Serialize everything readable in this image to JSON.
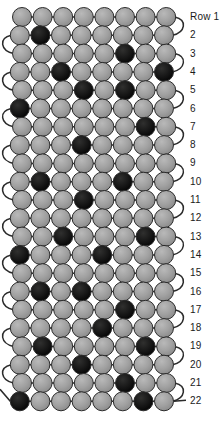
{
  "legend": {
    "gray_bead_label": "light bead",
    "dark_bead_label": "dark bead",
    "gray_color": "#9a9a9a",
    "dark_color": "#1a1a1a",
    "outline_color": "#2b2b2b",
    "thread_color": "#2b2b2b",
    "background_color": "#ffffff"
  },
  "row_label_prefix": "Row",
  "row_labels": [
    "Row 1",
    "2",
    "3",
    "4",
    "5",
    "6",
    "7",
    "8",
    "9",
    "10",
    "11",
    "12",
    "13",
    "14",
    "15",
    "16",
    "17",
    "18",
    "19",
    "20",
    "21",
    "22"
  ],
  "chart_data": {
    "type": "heatmap",
    "xlabel": "",
    "ylabel": "",
    "beads_per_row": 8,
    "row_count": 22,
    "value_legend": {
      "0": "gray bead",
      "1": "dark bead"
    },
    "categories": [
      "1",
      "2",
      "3",
      "4",
      "5",
      "6",
      "7",
      "8"
    ],
    "rows": [
      {
        "row": 1,
        "label": "Row 1",
        "dark_positions": [],
        "values": [
          0,
          0,
          0,
          0,
          0,
          0,
          0,
          0
        ]
      },
      {
        "row": 2,
        "label": "2",
        "dark_positions": [
          2
        ],
        "values": [
          0,
          1,
          0,
          0,
          0,
          0,
          0,
          0
        ]
      },
      {
        "row": 3,
        "label": "3",
        "dark_positions": [
          6
        ],
        "values": [
          0,
          0,
          0,
          0,
          0,
          1,
          0,
          0
        ]
      },
      {
        "row": 4,
        "label": "4",
        "dark_positions": [
          3,
          8
        ],
        "values": [
          0,
          0,
          1,
          0,
          0,
          0,
          0,
          1
        ]
      },
      {
        "row": 5,
        "label": "5",
        "dark_positions": [
          4,
          6
        ],
        "values": [
          0,
          0,
          0,
          1,
          0,
          1,
          0,
          0
        ]
      },
      {
        "row": 6,
        "label": "6",
        "dark_positions": [
          1
        ],
        "values": [
          1,
          0,
          0,
          0,
          0,
          0,
          0,
          0
        ]
      },
      {
        "row": 7,
        "label": "7",
        "dark_positions": [
          7
        ],
        "values": [
          0,
          0,
          0,
          0,
          0,
          0,
          1,
          0
        ]
      },
      {
        "row": 8,
        "label": "8",
        "dark_positions": [
          4
        ],
        "values": [
          0,
          0,
          0,
          1,
          0,
          0,
          0,
          0
        ]
      },
      {
        "row": 9,
        "label": "9",
        "dark_positions": [],
        "values": [
          0,
          0,
          0,
          0,
          0,
          0,
          0,
          0
        ]
      },
      {
        "row": 10,
        "label": "10",
        "dark_positions": [
          2,
          6
        ],
        "values": [
          0,
          1,
          0,
          0,
          0,
          1,
          0,
          0
        ]
      },
      {
        "row": 11,
        "label": "11",
        "dark_positions": [
          4
        ],
        "values": [
          0,
          0,
          0,
          1,
          0,
          0,
          0,
          0
        ]
      },
      {
        "row": 12,
        "label": "12",
        "dark_positions": [],
        "values": [
          0,
          0,
          0,
          0,
          0,
          0,
          0,
          0
        ]
      },
      {
        "row": 13,
        "label": "13",
        "dark_positions": [
          3,
          7
        ],
        "values": [
          0,
          0,
          1,
          0,
          0,
          0,
          1,
          0
        ]
      },
      {
        "row": 14,
        "label": "14",
        "dark_positions": [
          1,
          5
        ],
        "values": [
          1,
          0,
          0,
          0,
          1,
          0,
          0,
          0
        ]
      },
      {
        "row": 15,
        "label": "15",
        "dark_positions": [],
        "values": [
          0,
          0,
          0,
          0,
          0,
          0,
          0,
          0
        ]
      },
      {
        "row": 16,
        "label": "16",
        "dark_positions": [
          2,
          4
        ],
        "values": [
          0,
          1,
          0,
          1,
          0,
          0,
          0,
          0
        ]
      },
      {
        "row": 17,
        "label": "17",
        "dark_positions": [
          6
        ],
        "values": [
          0,
          0,
          0,
          0,
          0,
          1,
          0,
          0
        ]
      },
      {
        "row": 18,
        "label": "18",
        "dark_positions": [
          5
        ],
        "values": [
          0,
          0,
          0,
          0,
          1,
          0,
          0,
          0
        ]
      },
      {
        "row": 19,
        "label": "19",
        "dark_positions": [
          2,
          7
        ],
        "values": [
          0,
          1,
          0,
          0,
          0,
          0,
          1,
          0
        ]
      },
      {
        "row": 20,
        "label": "20",
        "dark_positions": [
          4
        ],
        "values": [
          0,
          0,
          0,
          1,
          0,
          0,
          0,
          0
        ]
      },
      {
        "row": 21,
        "label": "21",
        "dark_positions": [
          6
        ],
        "values": [
          0,
          0,
          0,
          0,
          0,
          1,
          0,
          0
        ]
      },
      {
        "row": 22,
        "label": "22",
        "dark_positions": [
          1,
          7
        ],
        "values": [
          1,
          0,
          0,
          0,
          0,
          0,
          1,
          0
        ]
      }
    ]
  },
  "geometry": {
    "bead_diameter": 19,
    "bead_radius": 9.5,
    "row_pitch": 18.3,
    "first_row_center_y": 17,
    "left_margin": 22,
    "bead_pitch": 20.6,
    "label_x": 190,
    "loop_side_first": "right"
  }
}
